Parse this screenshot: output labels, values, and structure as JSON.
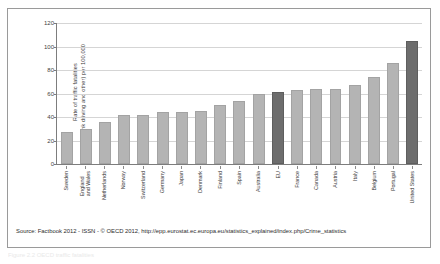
{
  "figure": {
    "source_note": "Source: Factbook 2012 - ISSN - © OECD 2012, http://epp.eurostat.ec.europa.eu/statistics_explained/index.php/Crime_statistics",
    "caption": "Figure 2.2  OECD traffic fatalities",
    "colors": {
      "bar": "#b4b4b4",
      "bar_highlight": "#6d6d6d",
      "axis": "#7d7d7d",
      "grid": "#d5d5d5",
      "border": "#9a9a9a"
    }
  },
  "chart_data": {
    "type": "bar",
    "title": "",
    "xlabel": "",
    "ylabel": "Rate of traffic fatalities (drunk driving and other) per 100,000",
    "ylabel_lines": [
      "Rate of traffic fatalities",
      "(drunk driving and other) per 100,000"
    ],
    "ylim": [
      0,
      120
    ],
    "yticks": [
      0,
      20,
      40,
      60,
      80,
      100,
      120
    ],
    "grid": true,
    "legend": "none",
    "highlight_categories": [
      "EU",
      "United States"
    ],
    "categories": [
      "Sweden",
      "England\nand Wales",
      "Netherlands",
      "Norway",
      "Switzerland",
      "Germany",
      "Japan",
      "Denmark",
      "Finland",
      "Spain",
      "Australia",
      "EU",
      "France",
      "Canada",
      "Austria",
      "Italy",
      "Belgium",
      "Portugal",
      "United States"
    ],
    "values": [
      27,
      30,
      36,
      42,
      42,
      44,
      44,
      45,
      50,
      54,
      60,
      61,
      63,
      64,
      64,
      67,
      74,
      86,
      105
    ]
  }
}
